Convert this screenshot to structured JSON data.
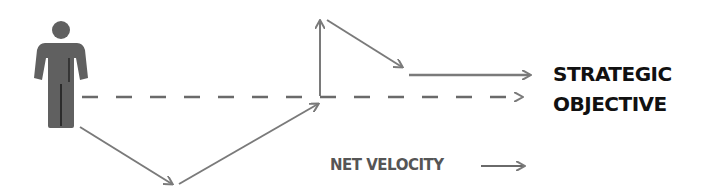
{
  "diagram": {
    "colors": {
      "person": "#606060",
      "arrow": "#7a7a7a",
      "label_primary": "#111111",
      "label_secondary": "#555555",
      "background": "#ffffff"
    },
    "person": {
      "icon": "person-icon"
    },
    "target_label": {
      "line1": "STRATEGIC",
      "line2": "OBJECTIVE"
    },
    "velocity_label": "NET VELOCITY",
    "path_segments": [
      {
        "id": "seg-1",
        "direction": "down-right"
      },
      {
        "id": "seg-2",
        "direction": "up-right"
      },
      {
        "id": "seg-3",
        "direction": "up"
      },
      {
        "id": "seg-4",
        "direction": "down-right"
      },
      {
        "id": "seg-5",
        "direction": "right"
      }
    ],
    "direct_line": {
      "style": "dashed",
      "direction": "right"
    }
  }
}
